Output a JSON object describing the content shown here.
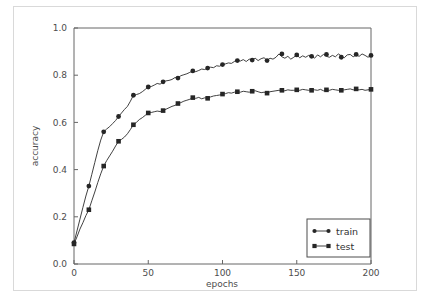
{
  "figure": {
    "background_color": "#ffffff",
    "border_color": "#d9d9d9",
    "axes_color": "#666666"
  },
  "chart_data": {
    "type": "line",
    "title": "",
    "subtitle": "",
    "xlabel": "epochs",
    "ylabel": "accuracy",
    "xlim": [
      0,
      200
    ],
    "ylim": [
      0.0,
      1.0
    ],
    "xticks": [
      0,
      50,
      100,
      150,
      200
    ],
    "xtick_labels": [
      "0",
      "50",
      "100",
      "150",
      "200"
    ],
    "yticks": [
      0.0,
      0.2,
      0.4,
      0.6,
      0.8,
      1.0
    ],
    "ytick_labels": [
      "0.0",
      "0.2",
      "0.4",
      "0.6",
      "0.8",
      "1.0"
    ],
    "grid": false,
    "legend_position": "lower right",
    "marker_every": 10,
    "line_color": "#2b2b2b",
    "marker_color": "#262626",
    "series": [
      {
        "name": "train",
        "label": "train",
        "marker": "circle",
        "x": [
          0,
          2,
          4,
          6,
          8,
          10,
          12,
          14,
          16,
          18,
          20,
          22,
          24,
          26,
          28,
          30,
          32,
          34,
          36,
          38,
          40,
          42,
          44,
          46,
          48,
          50,
          52,
          54,
          56,
          58,
          60,
          62,
          64,
          66,
          68,
          70,
          72,
          74,
          76,
          78,
          80,
          82,
          84,
          86,
          88,
          90,
          92,
          94,
          96,
          98,
          100,
          102,
          104,
          106,
          108,
          110,
          112,
          114,
          116,
          118,
          120,
          122,
          124,
          126,
          128,
          130,
          132,
          134,
          136,
          138,
          140,
          142,
          144,
          146,
          148,
          150,
          152,
          154,
          156,
          158,
          160,
          162,
          164,
          166,
          168,
          170,
          172,
          174,
          176,
          178,
          180,
          182,
          184,
          186,
          188,
          190,
          192,
          194,
          196,
          198,
          200
        ],
        "y": [
          0.09,
          0.14,
          0.19,
          0.24,
          0.288,
          0.33,
          0.38,
          0.43,
          0.48,
          0.525,
          0.56,
          0.572,
          0.582,
          0.595,
          0.608,
          0.625,
          0.64,
          0.655,
          0.668,
          0.69,
          0.715,
          0.718,
          0.722,
          0.73,
          0.74,
          0.75,
          0.752,
          0.758,
          0.765,
          0.762,
          0.772,
          0.776,
          0.778,
          0.782,
          0.79,
          0.788,
          0.798,
          0.802,
          0.806,
          0.812,
          0.818,
          0.815,
          0.82,
          0.826,
          0.824,
          0.83,
          0.834,
          0.832,
          0.84,
          0.838,
          0.845,
          0.848,
          0.852,
          0.85,
          0.858,
          0.862,
          0.86,
          0.866,
          0.858,
          0.868,
          0.864,
          0.872,
          0.862,
          0.87,
          0.874,
          0.862,
          0.872,
          0.868,
          0.876,
          0.89,
          0.878,
          0.872,
          0.88,
          0.868,
          0.876,
          0.886,
          0.874,
          0.882,
          0.876,
          0.884,
          0.88,
          0.872,
          0.886,
          0.878,
          0.888,
          0.88,
          0.876,
          0.884,
          0.878,
          0.89,
          0.882,
          0.874,
          0.886,
          0.888,
          0.878,
          0.886,
          0.88,
          0.89,
          0.884,
          0.876,
          0.884
        ],
        "marker_x": [
          0,
          10,
          20,
          30,
          40,
          50,
          60,
          70,
          80,
          90,
          100,
          110,
          120,
          130,
          140,
          150,
          160,
          170,
          180,
          190,
          200
        ],
        "marker_y": [
          0.09,
          0.33,
          0.56,
          0.625,
          0.715,
          0.75,
          0.772,
          0.788,
          0.818,
          0.83,
          0.845,
          0.862,
          0.864,
          0.862,
          0.89,
          0.886,
          0.88,
          0.888,
          0.876,
          0.888,
          0.884
        ]
      },
      {
        "name": "test",
        "label": "test",
        "marker": "square",
        "x": [
          0,
          2,
          4,
          6,
          8,
          10,
          12,
          14,
          16,
          18,
          20,
          22,
          24,
          26,
          28,
          30,
          32,
          34,
          36,
          38,
          40,
          42,
          44,
          46,
          48,
          50,
          52,
          54,
          56,
          58,
          60,
          62,
          64,
          66,
          68,
          70,
          72,
          74,
          76,
          78,
          80,
          82,
          84,
          86,
          88,
          90,
          92,
          94,
          96,
          98,
          100,
          102,
          104,
          106,
          108,
          110,
          112,
          114,
          116,
          118,
          120,
          122,
          124,
          126,
          128,
          130,
          132,
          134,
          136,
          138,
          140,
          142,
          144,
          146,
          148,
          150,
          152,
          154,
          156,
          158,
          160,
          162,
          164,
          166,
          168,
          170,
          172,
          174,
          176,
          178,
          180,
          182,
          184,
          186,
          188,
          190,
          192,
          194,
          196,
          198,
          200
        ],
        "y": [
          0.085,
          0.115,
          0.148,
          0.175,
          0.205,
          0.23,
          0.268,
          0.305,
          0.345,
          0.382,
          0.415,
          0.438,
          0.458,
          0.478,
          0.5,
          0.52,
          0.528,
          0.538,
          0.552,
          0.57,
          0.59,
          0.6,
          0.612,
          0.62,
          0.63,
          0.64,
          0.642,
          0.645,
          0.648,
          0.646,
          0.65,
          0.656,
          0.662,
          0.668,
          0.672,
          0.68,
          0.684,
          0.69,
          0.694,
          0.698,
          0.705,
          0.702,
          0.706,
          0.7,
          0.704,
          0.702,
          0.708,
          0.712,
          0.714,
          0.716,
          0.72,
          0.722,
          0.726,
          0.724,
          0.728,
          0.73,
          0.728,
          0.732,
          0.73,
          0.728,
          0.732,
          0.734,
          0.73,
          0.726,
          0.728,
          0.724,
          0.73,
          0.732,
          0.734,
          0.736,
          0.736,
          0.734,
          0.738,
          0.736,
          0.736,
          0.738,
          0.736,
          0.74,
          0.738,
          0.736,
          0.74,
          0.738,
          0.736,
          0.74,
          0.734,
          0.738,
          0.736,
          0.74,
          0.738,
          0.736,
          0.736,
          0.738,
          0.74,
          0.742,
          0.738,
          0.74,
          0.738,
          0.74,
          0.736,
          0.738,
          0.74
        ],
        "marker_x": [
          0,
          10,
          20,
          30,
          40,
          50,
          60,
          70,
          80,
          90,
          100,
          110,
          120,
          130,
          140,
          150,
          160,
          170,
          180,
          190,
          200
        ],
        "marker_y": [
          0.085,
          0.23,
          0.415,
          0.52,
          0.59,
          0.64,
          0.65,
          0.68,
          0.705,
          0.702,
          0.72,
          0.73,
          0.732,
          0.724,
          0.736,
          0.738,
          0.736,
          0.738,
          0.736,
          0.742,
          0.74
        ]
      }
    ]
  }
}
